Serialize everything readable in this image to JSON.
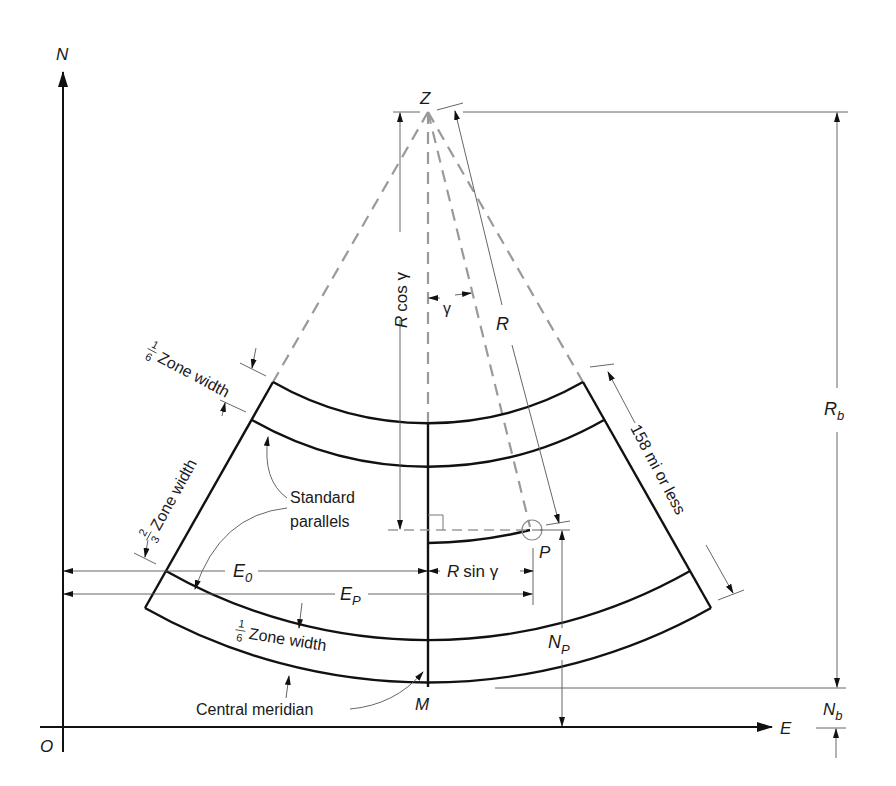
{
  "diagram": {
    "axes": {
      "north_label": "N",
      "east_label": "E",
      "origin_label": "O"
    },
    "points": {
      "apex": "Z",
      "point": "P",
      "meridian_point": "M"
    },
    "dimensions": {
      "r_cos": "R cos γ",
      "r_sin": "R sin γ",
      "gamma": "γ",
      "radius": "R",
      "rb_main": "R",
      "rb_sub": "b",
      "nb_main": "N",
      "nb_sub": "b",
      "np_main": "N",
      "np_sub": "P",
      "e0_main": "E",
      "e0_sub": "0",
      "ep_main": "E",
      "ep_sub": "P",
      "zone_length": "158 mi or less"
    },
    "annotations": {
      "top_fraction_num": "1",
      "top_fraction_den": "6",
      "top_zone": "Zone width",
      "mid_fraction_num": "2",
      "mid_fraction_den": "3",
      "mid_zone": "Zone width",
      "bottom_fraction_num": "1",
      "bottom_fraction_den": "6",
      "bottom_zone": "Zone width",
      "standard_line1": "Standard",
      "standard_line2": "parallels",
      "central_meridian": "Central meridian"
    }
  }
}
